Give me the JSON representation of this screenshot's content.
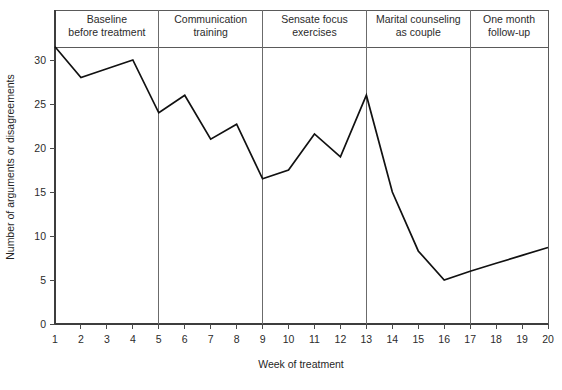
{
  "chart_data": {
    "type": "line",
    "title": "",
    "xlabel": "Week of treatment",
    "ylabel": "Number of arguments or disagreements",
    "xlim": [
      1,
      20
    ],
    "ylim": [
      0,
      33
    ],
    "grid": false,
    "legend": "none",
    "x": [
      1,
      2,
      3,
      4,
      5,
      6,
      7,
      8,
      9,
      10,
      11,
      12,
      13,
      14,
      15,
      16,
      17,
      18,
      19,
      20
    ],
    "values": [
      31.5,
      28,
      29,
      30,
      24,
      26,
      21,
      22.7,
      16.5,
      17.5,
      21.6,
      19,
      26,
      15,
      8.3,
      5,
      6,
      6.9,
      7.8,
      8.7
    ],
    "series": [
      {
        "name": "Number of arguments or disagreements",
        "values": [
          31.5,
          28,
          29,
          30,
          24,
          26,
          21,
          22.7,
          16.5,
          17.5,
          21.6,
          19,
          26,
          15,
          8.3,
          5,
          6,
          6.9,
          7.8,
          8.7
        ]
      }
    ],
    "x_tick_labels": [
      "1",
      "2",
      "3",
      "4",
      "5",
      "6",
      "7",
      "8",
      "9",
      "10",
      "11",
      "12",
      "13",
      "14",
      "15",
      "16",
      "17",
      "18",
      "19",
      "20"
    ],
    "y_tick_labels": [
      "0",
      "5",
      "10",
      "15",
      "20",
      "25",
      "30"
    ],
    "y_ticks": [
      0,
      5,
      10,
      15,
      20,
      25,
      30
    ],
    "phases": [
      {
        "label_line1": "Baseline",
        "label_line2": "before treatment",
        "start_week": 1,
        "end_week": 5
      },
      {
        "label_line1": "Communication",
        "label_line2": "training",
        "start_week": 5,
        "end_week": 9
      },
      {
        "label_line1": "Sensate focus",
        "label_line2": "exercises",
        "start_week": 9,
        "end_week": 13
      },
      {
        "label_line1": "Marital counseling",
        "label_line2": "as couple",
        "start_week": 13,
        "end_week": 17
      },
      {
        "label_line1": "One month",
        "label_line2": "follow-up",
        "start_week": 17,
        "end_week": 20
      }
    ],
    "phase_dividers": [
      5,
      9,
      13,
      17
    ],
    "colors": {
      "line": "#111111",
      "axis": "#3d3d3d",
      "frame": "#5a5a5a",
      "divider": "#6b6b6b",
      "text": "#2b2b2b",
      "background": "#ffffff"
    }
  }
}
